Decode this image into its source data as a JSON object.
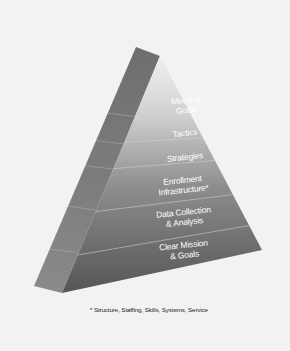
{
  "diagram": {
    "type": "pyramid",
    "tiers_top_to_bottom": [
      {
        "line1": "Meeting",
        "line2": "Goals"
      },
      {
        "line1": "Tactics",
        "line2": ""
      },
      {
        "line1": "Strategies",
        "line2": ""
      },
      {
        "line1": "Enrollment",
        "line2": "Infrastructure*"
      },
      {
        "line1": "Data Collection",
        "line2": "& Analysis"
      },
      {
        "line1": "Clear Mission",
        "line2": "& Goals"
      }
    ],
    "footnote": "* Structure, Staffing, Skills, Systems, Service",
    "colors": {
      "background": "#f2f2f2",
      "side_face": "#7a7a7a",
      "front_face_top": "#e6e6e6",
      "front_face_bottom": "#5a5a5a",
      "label_text": "#ffffff",
      "divider": "#c8c8c8"
    }
  }
}
